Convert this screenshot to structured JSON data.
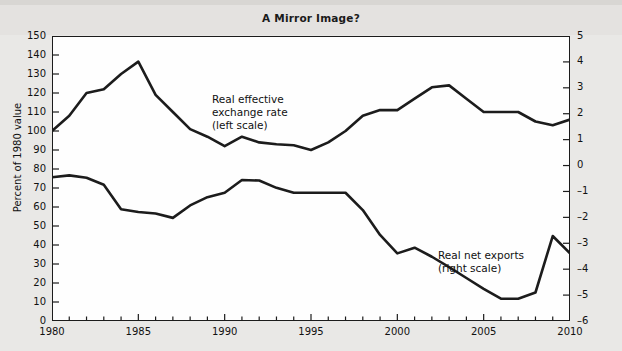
{
  "figure": {
    "title": "A Mirror Image?",
    "background_color": "#e9e8e6",
    "plot_background_color": "#fefefe",
    "line_color": "#1c1c1c"
  },
  "axes": {
    "left": {
      "title": "Percent of 1980 value",
      "ticks": [
        0,
        10,
        20,
        30,
        40,
        50,
        60,
        70,
        80,
        90,
        100,
        110,
        120,
        130,
        140,
        150
      ],
      "min": 0,
      "max": 150
    },
    "right": {
      "title": "Percent of GDP",
      "ticks": [
        -6,
        -5,
        -4,
        -3,
        -2,
        -1,
        0,
        1,
        2,
        3,
        4,
        5
      ],
      "tick_labels": [
        "–6",
        "–5",
        "–4",
        "–3",
        "–2",
        "–1",
        "0",
        "1",
        "2",
        "3",
        "4",
        "5"
      ],
      "min": -6,
      "max": 5
    },
    "bottom": {
      "labeled_ticks": [
        1980,
        1985,
        1990,
        1995,
        2000,
        2005,
        2010
      ],
      "min": 1980,
      "max": 2010,
      "minor_tick_step": 1
    }
  },
  "annotations": {
    "exchange_rate": "Real effective\nexchange rate\n(left scale)",
    "net_exports": "Real net exports\n(right scale)"
  },
  "chart_data": {
    "type": "line",
    "title": "A Mirror Image?",
    "xlabel": "",
    "ylabel": "Percent of 1980 value",
    "ylabel_secondary": "Percent of GDP",
    "xlim": [
      1980,
      2010
    ],
    "ylim": [
      0,
      150
    ],
    "ylim_secondary": [
      -6,
      5
    ],
    "grid": false,
    "legend": "inline-annotations",
    "x": [
      1980,
      1981,
      1982,
      1983,
      1984,
      1985,
      1986,
      1987,
      1988,
      1989,
      1990,
      1991,
      1992,
      1993,
      1994,
      1995,
      1996,
      1997,
      1998,
      1999,
      2000,
      2001,
      2002,
      2003,
      2004,
      2005,
      2006,
      2007,
      2008,
      2009,
      2010
    ],
    "series": [
      {
        "name": "Real effective exchange rate (left scale)",
        "axis": "left",
        "unit": "Percent of 1980 value",
        "values": [
          100,
          108,
          120,
          122,
          130,
          136.5,
          119,
          110,
          101,
          97,
          92,
          97,
          94,
          93,
          92.5,
          90,
          94,
          100,
          108,
          111,
          111,
          117,
          123,
          124,
          117,
          110,
          110,
          110,
          105,
          103,
          106
        ]
      },
      {
        "name": "Real net exports (right scale)",
        "axis": "right",
        "unit": "Percent of GDP",
        "values": [
          -0.45,
          -0.38,
          -0.47,
          -0.74,
          -1.69,
          -1.79,
          -1.85,
          -2.02,
          -1.54,
          -1.22,
          -1.05,
          -0.56,
          -0.58,
          -0.86,
          -1.05,
          -1.05,
          -1.05,
          -1.05,
          -1.72,
          -2.68,
          -3.39,
          -3.17,
          -3.52,
          -3.92,
          -4.34,
          -4.76,
          -5.14,
          -5.14,
          -4.9,
          -2.72,
          -3.39
        ]
      }
    ]
  }
}
